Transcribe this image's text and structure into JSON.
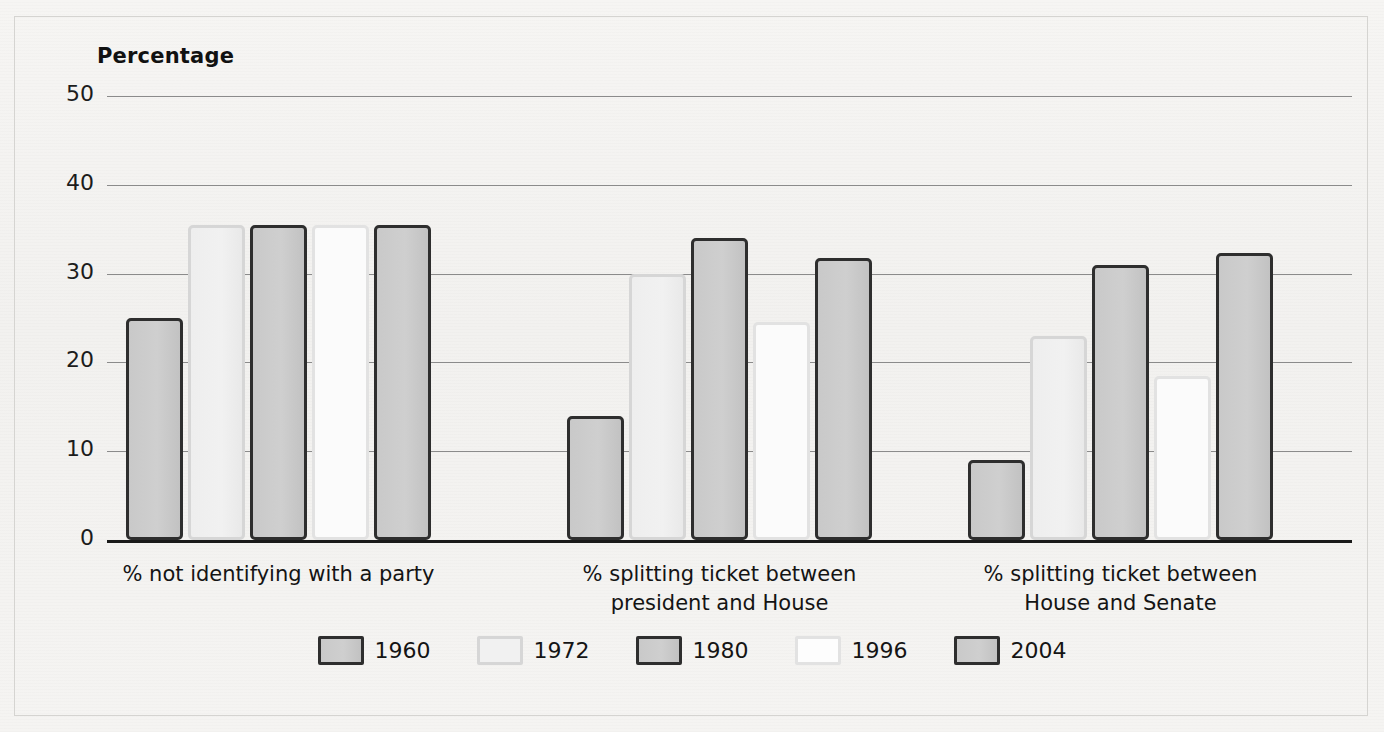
{
  "figure": {
    "axis_title": "Percentage"
  },
  "chart_data": {
    "type": "bar",
    "title": "Percentage",
    "xlabel": "",
    "ylabel": "Percentage",
    "ylim": [
      0,
      50
    ],
    "yticks": [
      0,
      10,
      20,
      30,
      40,
      50
    ],
    "ytick_labels": [
      "0",
      "10",
      "20",
      "30",
      "40",
      "50"
    ],
    "grid": true,
    "legend_position": "bottom",
    "categories": [
      "% not identifying with a party",
      "% splitting ticket between president and House",
      "% splitting ticket between House and Senate"
    ],
    "category_lines": [
      [
        "% not identifying with a party"
      ],
      [
        "% splitting ticket between",
        "president and House"
      ],
      [
        "% splitting ticket between",
        "House and Senate"
      ]
    ],
    "series": [
      {
        "name": "1960",
        "style": "style-dark",
        "values": [
          25,
          14,
          9
        ]
      },
      {
        "name": "1972",
        "style": "style-light",
        "values": [
          35.5,
          30,
          23
        ]
      },
      {
        "name": "1980",
        "style": "style-dark",
        "values": [
          35.5,
          34,
          31
        ]
      },
      {
        "name": "1996",
        "style": "style-white",
        "values": [
          35.5,
          24.5,
          18.5
        ]
      },
      {
        "name": "2004",
        "style": "style-dark",
        "values": [
          35.5,
          31.8,
          32.3
        ]
      }
    ]
  },
  "legend": {
    "items": [
      {
        "label": "1960",
        "style": "style-dark"
      },
      {
        "label": "1972",
        "style": "style-light"
      },
      {
        "label": "1980",
        "style": "style-dark"
      },
      {
        "label": "1996",
        "style": "style-white"
      },
      {
        "label": "2004",
        "style": "style-dark"
      }
    ]
  },
  "colors": {
    "bar_fill_gray": "#cbcbcb",
    "bar_border_dark": "#2e2e2e",
    "bar_fill_light": "#f1f1f1",
    "bar_border_light": "#d6d6d6",
    "bar_fill_white": "#fbfbfb",
    "gridline": "#8b8b8b",
    "axis": "#1a1a1a",
    "text": "#141414",
    "page_background": "#f4f3f1"
  }
}
